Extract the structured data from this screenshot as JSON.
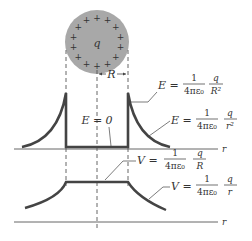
{
  "figure": {
    "sphere": {
      "charge_label": "q",
      "plus_sign": "+",
      "fill": "#a8a8a8"
    },
    "radius_label": "R",
    "axis_label_r": "r",
    "field": {
      "inside_label": "E = 0",
      "surface": {
        "lhs": "E =",
        "num": "1",
        "den": "4πε₀",
        "q": "q",
        "r": "R²"
      },
      "outside": {
        "lhs": "E =",
        "num": "1",
        "den": "4πε₀",
        "q": "q",
        "r": "r²"
      }
    },
    "potential": {
      "inside": {
        "lhs": "V =",
        "num": "1",
        "den": "4πε₀",
        "q": "q",
        "r": "R"
      },
      "outside": {
        "lhs": "V =",
        "num": "1",
        "den": "4πε₀",
        "q": "q",
        "r": "r"
      }
    },
    "colors": {
      "curve": "#444444",
      "axis": "#555555",
      "text": "#333333"
    }
  }
}
